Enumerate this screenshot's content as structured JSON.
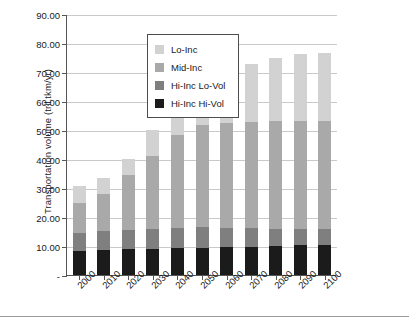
{
  "chart_data": {
    "type": "bar",
    "stacked": true,
    "title": "",
    "xlabel": "",
    "ylabel": "Transportation volume (tril.tkm/yr)",
    "categories": [
      "2000",
      "2010",
      "2020",
      "2030",
      "2040",
      "2050",
      "2060",
      "2070",
      "2080",
      "2090",
      "2100"
    ],
    "series": [
      {
        "name": "Hi-Inc Hi-Vol",
        "color": "#1b1b1b",
        "values": [
          8.4,
          8.6,
          8.8,
          9.0,
          9.2,
          9.4,
          9.6,
          9.8,
          10.0,
          10.2,
          10.3
        ]
      },
      {
        "name": "Hi-Inc Lo-Vol",
        "color": "#7f7f7f",
        "values": [
          6.1,
          6.5,
          6.8,
          7.0,
          7.1,
          7.0,
          6.6,
          6.3,
          6.0,
          5.7,
          5.5
        ]
      },
      {
        "name": "Mid-Inc",
        "color": "#a9a9a9",
        "values": [
          10.3,
          13.0,
          18.9,
          25.0,
          32.0,
          35.4,
          36.3,
          36.8,
          37.1,
          37.2,
          37.3
        ]
      },
      {
        "name": "Lo-Inc",
        "color": "#d2d2d2",
        "values": [
          5.8,
          5.3,
          5.6,
          9.0,
          9.4,
          13.7,
          17.4,
          20.0,
          21.8,
          23.0,
          23.6
        ]
      }
    ],
    "totals": [
      30.6,
      33.4,
      40.1,
      50.0,
      57.7,
      65.5,
      69.9,
      72.9,
      74.9,
      76.1,
      76.7
    ],
    "ylim": [
      0,
      90
    ],
    "yticks": [
      "-",
      "10.00",
      "20.00",
      "30.00",
      "40.00",
      "50.00",
      "60.00",
      "70.00",
      "80.00",
      "90.00"
    ],
    "ytick_values": [
      0,
      10,
      20,
      30,
      40,
      50,
      60,
      70,
      80,
      90
    ],
    "grid": true,
    "legend_position": "top-left"
  },
  "legend": {
    "items": [
      {
        "label": "Lo-Inc",
        "color": "#d2d2d2"
      },
      {
        "label": "Mid-Inc",
        "color": "#a9a9a9"
      },
      {
        "label": "Hi-Inc Lo-Vol",
        "color": "#7f7f7f"
      },
      {
        "label": "Hi-Inc Hi-Vol",
        "color": "#1b1b1b"
      }
    ]
  }
}
